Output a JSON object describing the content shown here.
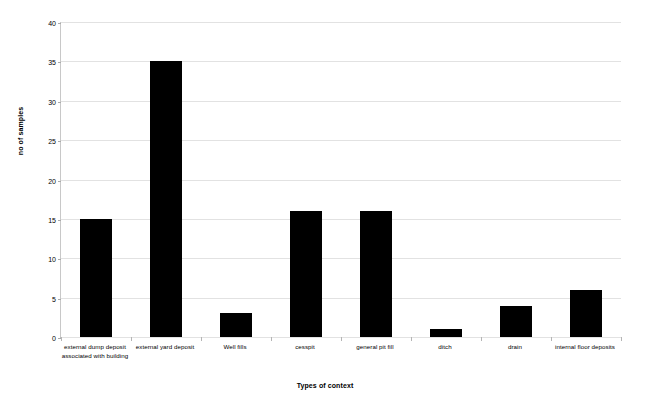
{
  "chart_data": {
    "type": "bar",
    "title": "",
    "xlabel": "Types of context",
    "ylabel": "no of samples",
    "categories": [
      "external dump deposit associated with building",
      "external yard deposit",
      "Well fills",
      "cesspit",
      "general pit fill",
      "ditch",
      "drain",
      "internal floor deposits"
    ],
    "values": [
      15,
      35,
      3,
      16,
      16,
      1,
      4,
      6
    ],
    "ylim": [
      0,
      40
    ],
    "ytick_labels": [
      "0",
      "5",
      "10",
      "15",
      "20",
      "25",
      "30",
      "35",
      "40"
    ],
    "ytick_values": [
      0,
      5,
      10,
      15,
      20,
      25,
      30,
      35,
      40
    ],
    "grid": true,
    "legend": "none",
    "bar_color": "#000000",
    "grid_color": "#e2e2e2",
    "background_color": "#ffffff"
  }
}
